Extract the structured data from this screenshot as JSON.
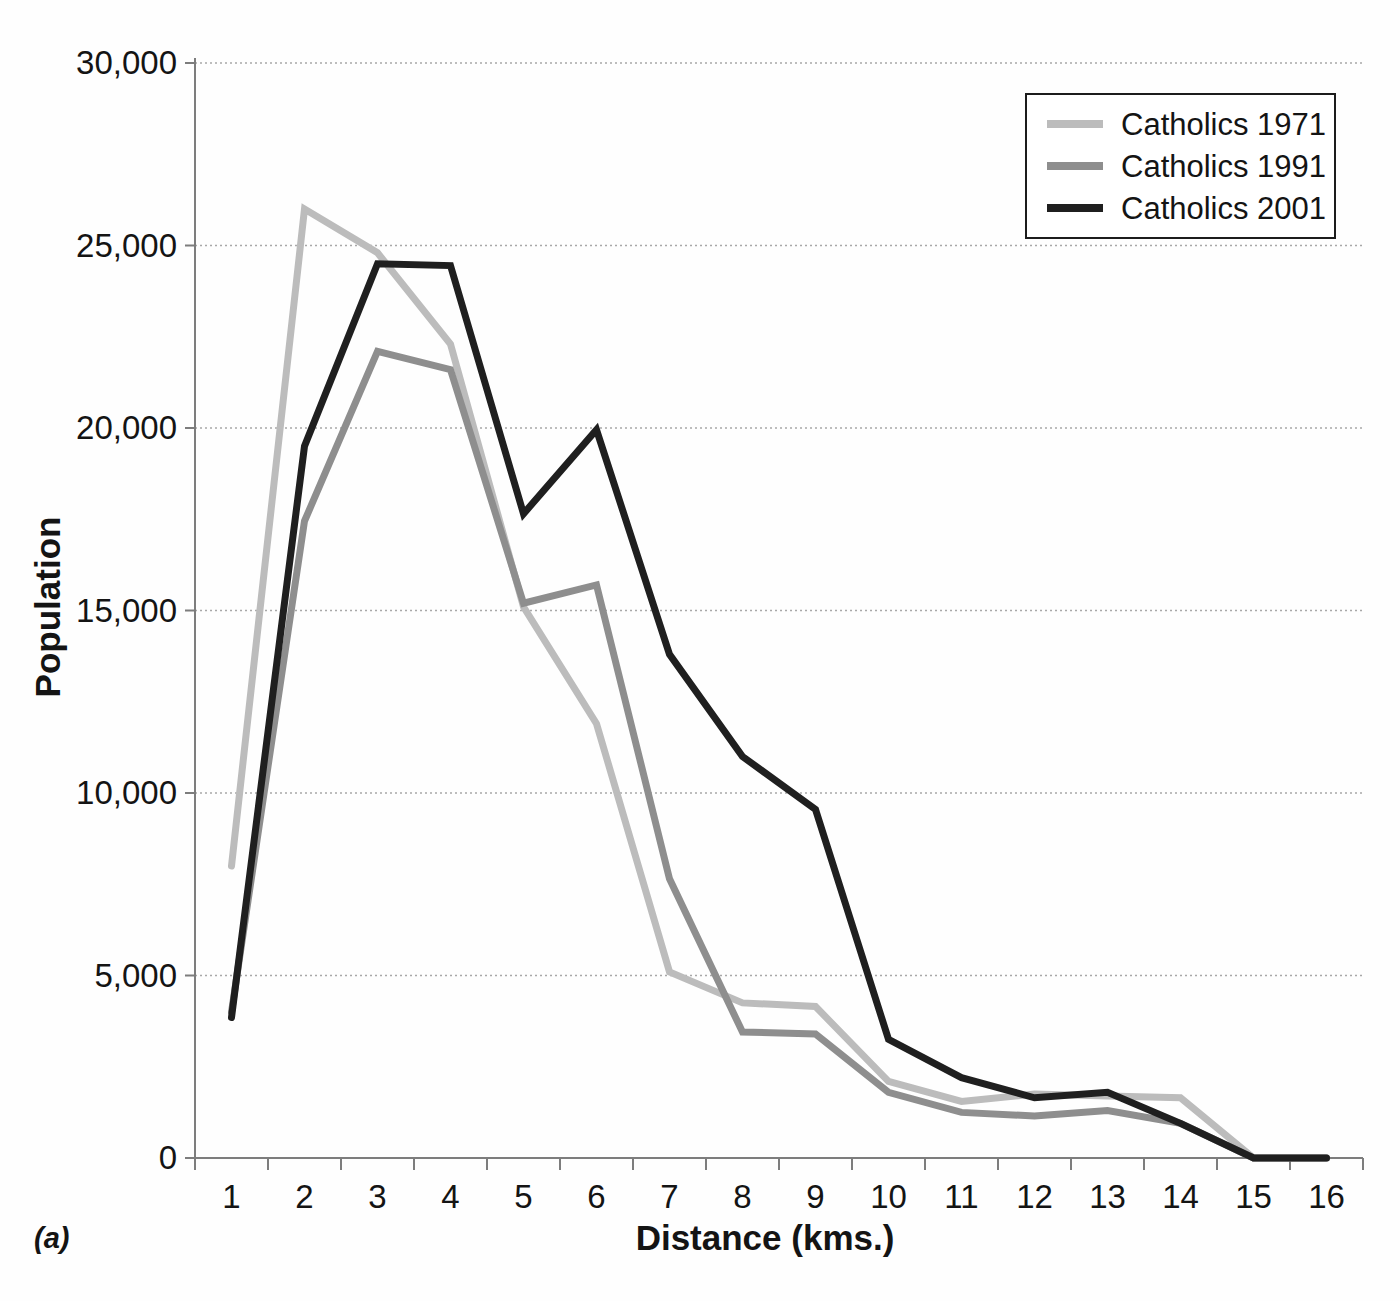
{
  "figure": {
    "panel_label": "(a)"
  },
  "chart_data": {
    "type": "line",
    "title": "",
    "xlabel": "Distance (kms.)",
    "ylabel": "Population",
    "categories": [
      1,
      2,
      3,
      4,
      5,
      6,
      7,
      8,
      9,
      10,
      11,
      12,
      13,
      14,
      15,
      16
    ],
    "ylim": [
      0,
      30000
    ],
    "ytick_step": 5000,
    "ytick_labels": [
      "0",
      "5,000",
      "10,000",
      "15,000",
      "20,000",
      "25,000",
      "30,000"
    ],
    "grid": "horizontal-dotted",
    "legend_position": "top-right",
    "series": [
      {
        "name": "Catholics 1971",
        "color": "#bcbcbc",
        "values": [
          8000,
          26000,
          24800,
          22300,
          15100,
          11900,
          5100,
          4250,
          4150,
          2100,
          1550,
          1750,
          1700,
          1650,
          0,
          0
        ]
      },
      {
        "name": "Catholics 1991",
        "color": "#8e8e8e",
        "values": [
          4000,
          17450,
          22100,
          21600,
          15200,
          15700,
          7650,
          3450,
          3400,
          1800,
          1250,
          1150,
          1300,
          950,
          0,
          0
        ]
      },
      {
        "name": "Catholics 2001",
        "color": "#1f1f1f",
        "values": [
          3850,
          19500,
          24500,
          24450,
          17650,
          19950,
          13800,
          11000,
          9550,
          3250,
          2200,
          1650,
          1800,
          950,
          0,
          0
        ]
      }
    ]
  }
}
